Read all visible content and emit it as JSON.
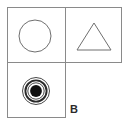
{
  "figure": {
    "panel_label": "B",
    "background_color": "#ffffff",
    "stroke_color": "#8a8a8a",
    "shape_stroke_color": "#6f6f6f",
    "fill_color": "#111111",
    "label_color": "#2b2b2b",
    "cells": [
      {
        "position": "top-left",
        "shape": "circle-outline",
        "shape_label": "open circle",
        "has_border": true
      },
      {
        "position": "top-right",
        "shape": "triangle-outline",
        "shape_label": "open triangle",
        "has_border": true
      },
      {
        "position": "bottom-left",
        "shape": "concentric-circles-filled",
        "shape_label": "bullseye with filled center",
        "ring_count": 3,
        "has_border": true
      },
      {
        "position": "bottom-right",
        "shape": "none",
        "shape_label": "empty",
        "has_border": false
      }
    ],
    "geometry": {
      "frame_left": 7,
      "frame_top": 7,
      "frame_right": 122,
      "divider_x": 65,
      "divider_y": 62,
      "bottom_left_cell_bottom": 118,
      "circle_cx": 35,
      "circle_cy": 36,
      "circle_r": 16,
      "triangle_apex_x": 94,
      "triangle_top_y": 23,
      "triangle_base_y": 50,
      "triangle_half_width": 17,
      "bullseye_cx": 36,
      "bullseye_cy": 91,
      "bullseye_radii": [
        14.0,
        11.0,
        8.5,
        6.0
      ]
    }
  }
}
